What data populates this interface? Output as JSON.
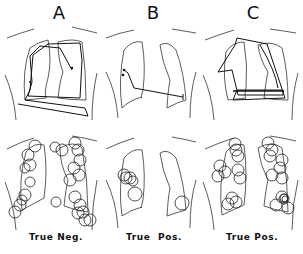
{
  "figure": {
    "columns": [
      {
        "letter": "A",
        "caption": "True Neg.",
        "letter_x": 44,
        "caption_x": 10
      },
      {
        "letter": "B",
        "caption": "True  Pos.",
        "letter_x": 138,
        "caption_x": 126
      },
      {
        "letter": "C",
        "caption": "True Pos.",
        "letter_x": 238,
        "caption_x": 226
      }
    ],
    "rows": [
      "scan-path",
      "fixations"
    ],
    "panels": {
      "A_top": {
        "scan_path": [
          [
            18,
            104
          ],
          [
            88,
            116
          ],
          [
            85,
            108
          ],
          [
            25,
            100
          ],
          [
            30,
            90
          ],
          [
            33,
            55
          ],
          [
            48,
            44
          ],
          [
            80,
            43
          ],
          [
            82,
            60
          ],
          [
            80,
            98
          ],
          [
            28,
            96
          ],
          [
            32,
            82
          ],
          [
            30,
            56
          ],
          [
            40,
            46
          ],
          [
            60,
            48
          ],
          [
            72,
            70
          ]
        ]
      },
      "B_top": {
        "scan_path": [
          [
            124,
            70
          ],
          [
            128,
            73
          ],
          [
            134,
            88
          ],
          [
            183,
            97
          ]
        ],
        "markers": [
          [
            124,
            70
          ],
          [
            123,
            75
          ],
          [
            183,
            97
          ]
        ]
      },
      "C_top": {
        "scan_path": [
          [
            237,
            38
          ],
          [
            267,
            44
          ],
          [
            285,
            98
          ],
          [
            233,
            100
          ],
          [
            237,
            90
          ],
          [
            283,
            90
          ],
          [
            283,
            95
          ],
          [
            238,
            95
          ],
          [
            232,
            70
          ],
          [
            218,
            72
          ],
          [
            235,
            45
          ],
          [
            237,
            38
          ]
        ]
      },
      "A_bottom": {
        "fixations": [
          [
            35,
            146,
            6
          ],
          [
            28,
            155,
            6
          ],
          [
            30,
            165,
            6
          ],
          [
            55,
            147,
            5
          ],
          [
            62,
            150,
            6
          ],
          [
            75,
            143,
            6
          ],
          [
            78,
            150,
            6
          ],
          [
            80,
            160,
            6
          ],
          [
            74,
            168,
            6
          ],
          [
            79,
            175,
            6
          ],
          [
            70,
            180,
            6
          ],
          [
            25,
            195,
            6
          ],
          [
            20,
            205,
            6
          ],
          [
            15,
            212,
            6
          ],
          [
            22,
            200,
            5
          ],
          [
            75,
            197,
            6
          ],
          [
            80,
            205,
            6
          ],
          [
            83,
            212,
            6
          ],
          [
            78,
            213,
            6
          ],
          [
            85,
            220,
            6
          ],
          [
            90,
            220,
            6
          ],
          [
            56,
            202,
            5
          ],
          [
            25,
            168,
            5
          ],
          [
            30,
            182,
            5
          ]
        ]
      },
      "B_bottom": {
        "fixations": [
          [
            124,
            175,
            6
          ],
          [
            126,
            178,
            6
          ],
          [
            130,
            178,
            6
          ],
          [
            133,
            181,
            5
          ],
          [
            135,
            194,
            7
          ],
          [
            182,
            203,
            7
          ]
        ]
      },
      "C_bottom": {
        "fixations": [
          [
            235,
            144,
            6
          ],
          [
            236,
            150,
            6
          ],
          [
            238,
            156,
            6
          ],
          [
            220,
            166,
            6
          ],
          [
            225,
            172,
            6
          ],
          [
            218,
            176,
            6
          ],
          [
            238,
            170,
            6
          ],
          [
            240,
            178,
            6
          ],
          [
            232,
            198,
            6
          ],
          [
            236,
            202,
            6
          ],
          [
            228,
            204,
            6
          ],
          [
            268,
            143,
            6
          ],
          [
            272,
            150,
            6
          ],
          [
            270,
            156,
            6
          ],
          [
            282,
            160,
            6
          ],
          [
            280,
            168,
            6
          ],
          [
            272,
            175,
            6
          ],
          [
            282,
            178,
            6
          ],
          [
            282,
            197,
            6
          ],
          [
            284,
            199,
            5
          ],
          [
            284,
            198,
            4
          ],
          [
            285,
            199,
            3
          ],
          [
            276,
            205,
            6
          ],
          [
            288,
            208,
            6
          ]
        ]
      }
    }
  }
}
